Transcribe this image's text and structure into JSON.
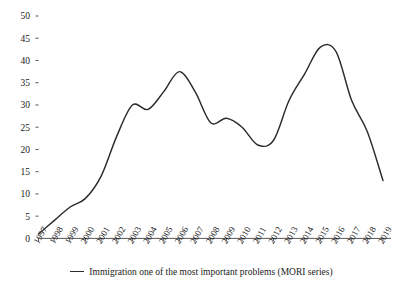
{
  "chart_data": {
    "type": "line",
    "title": "",
    "xlabel": "",
    "ylabel": "",
    "xlim": [
      1997,
      2019
    ],
    "ylim": [
      0,
      50
    ],
    "grid": false,
    "legend_position": "bottom-center",
    "line_color": "#2b2b2b",
    "axis_color": "#444444",
    "categories": [
      "1997",
      "1998",
      "1999",
      "2000",
      "2001",
      "2002",
      "2003",
      "2004",
      "2005",
      "2006",
      "2007",
      "2008",
      "2009",
      "2010",
      "2011",
      "2012",
      "2013",
      "2014",
      "2015",
      "2016",
      "2017",
      "2018",
      "2019"
    ],
    "x": [
      1997,
      1998,
      1999,
      2000,
      2001,
      2002,
      2003,
      2004,
      2005,
      2006,
      2007,
      2008,
      2009,
      2010,
      2011,
      2012,
      2013,
      2014,
      2015,
      2016,
      2017,
      2018,
      2019
    ],
    "series": [
      {
        "name": "Immigration one of the most important problems (MORI series)",
        "values": [
          1,
          4,
          7,
          9,
          14,
          23,
          30,
          29,
          33,
          37.5,
          33,
          26,
          27,
          25,
          21,
          22,
          31,
          37,
          43,
          42,
          31,
          24,
          13
        ]
      }
    ],
    "ytick_labels": [
      "0",
      "5",
      "10",
      "15",
      "20",
      "25",
      "30",
      "35",
      "40",
      "45",
      "50"
    ],
    "ytick_values": [
      0,
      5,
      10,
      15,
      20,
      25,
      30,
      35,
      40,
      45,
      50
    ],
    "legend": [
      {
        "label": "Immigration one of the most important problems (MORI series)",
        "color": "#2b2b2b",
        "marker": "line"
      }
    ]
  }
}
